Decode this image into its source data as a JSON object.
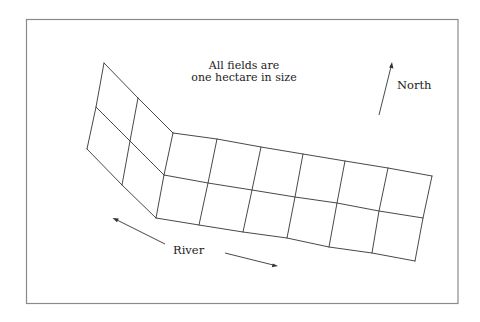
{
  "diagram": {
    "note": {
      "line1": "All fields are",
      "line2": "one hectare in size"
    },
    "compass": {
      "label": "North"
    },
    "river": {
      "label": "River"
    },
    "fields": {
      "left_section": {
        "rows": 2,
        "cols": 2,
        "count": 4
      },
      "right_section": {
        "rows": 2,
        "cols": 6,
        "count": 12
      },
      "total_fields": 16,
      "field_size": "one hectare"
    },
    "colors": {
      "frame": "#8a8a8a",
      "lines": "#333333",
      "background": "#ffffff"
    }
  }
}
